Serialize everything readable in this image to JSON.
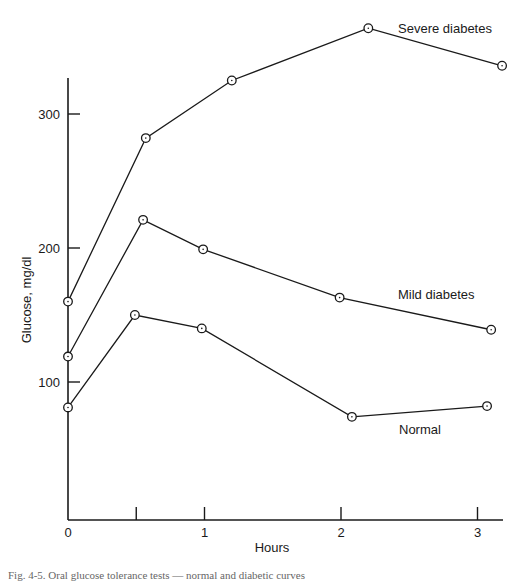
{
  "chart_data": {
    "type": "line",
    "title": "",
    "xlabel": "Hours",
    "ylabel": "Glucose, mg/dl",
    "xlim": [
      0,
      3.15
    ],
    "ylim": [
      0,
      340
    ],
    "x_ticks": [
      0,
      0.5,
      1,
      2,
      3
    ],
    "x_tick_labels": [
      "0",
      "",
      "1",
      "2",
      "3"
    ],
    "y_ticks": [
      100,
      200,
      300
    ],
    "y_tick_labels": [
      "100",
      "200",
      "300"
    ],
    "grid": false,
    "legend": "inline labels",
    "marker": "open circle with center dot",
    "series": [
      {
        "name": "Severe diabetes",
        "x": [
          0,
          0.57,
          1.2,
          2.2,
          3.18
        ],
        "values": [
          160,
          282,
          325,
          364,
          336
        ]
      },
      {
        "name": "Mild diabetes",
        "x": [
          0,
          0.55,
          0.99,
          1.99,
          3.1
        ],
        "values": [
          119,
          221,
          199,
          163,
          139
        ]
      },
      {
        "name": "Normal",
        "x": [
          0,
          0.49,
          0.98,
          2.08,
          3.07
        ],
        "values": [
          81,
          150,
          140,
          74,
          82
        ]
      }
    ]
  },
  "caption": "Fig. 4-5. Oral glucose tolerance tests — normal and diabetic curves",
  "colors": {
    "ink": "#1a1a1a",
    "background": "#ffffff"
  }
}
